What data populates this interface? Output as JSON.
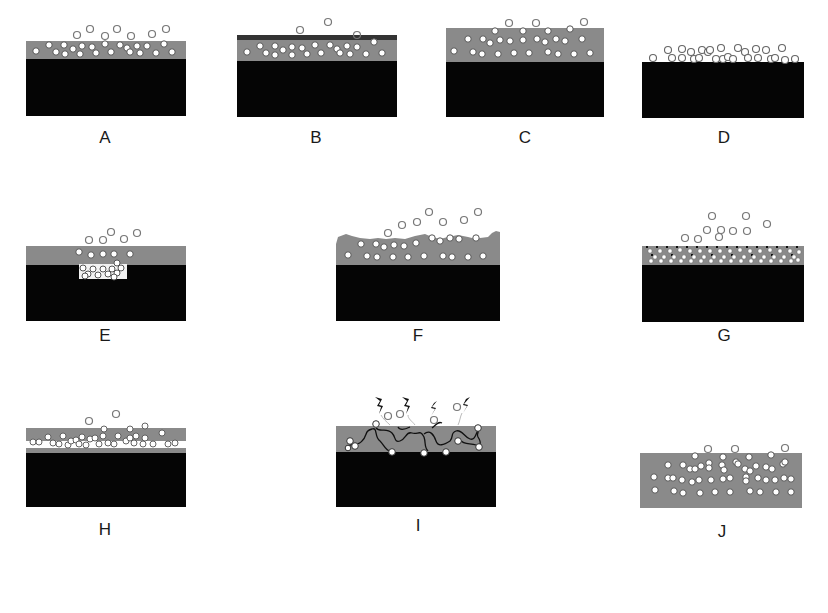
{
  "figure": {
    "colors": {
      "substrate": "#050505",
      "coating": "#8a8a8a",
      "dark_topcoat": "#333333",
      "particle_fill": "#ffffff",
      "particle_stroke": "#666666",
      "background": "#ffffff"
    },
    "panels": [
      {
        "id": "A",
        "label": "A",
        "description": "Particles dispersed in coating layer, some released above surface"
      },
      {
        "id": "B",
        "label": "B",
        "description": "Coating with dark top barrier layer, few particles released"
      },
      {
        "id": "C",
        "label": "C",
        "description": "Thick coating with particles throughout, some released"
      },
      {
        "id": "D",
        "label": "D",
        "description": "Particles deposited directly on substrate surface without coating"
      },
      {
        "id": "E",
        "label": "E",
        "description": "Particle reservoir embedded in substrate beneath coating"
      },
      {
        "id": "F",
        "label": "F",
        "description": "Eroding/degrading rough coating surface releasing particles"
      },
      {
        "id": "G",
        "label": "G",
        "description": "Porous/structured coating layer with dense particle lattice"
      },
      {
        "id": "H",
        "label": "H",
        "description": "Multilayer coating with particle-rich interlayer"
      },
      {
        "id": "I",
        "label": "I",
        "description": "Polymer chains tethering particles, cleaved by stimulus (lightning)"
      },
      {
        "id": "J",
        "label": "J",
        "description": "Free-standing particle-loaded film without substrate"
      }
    ]
  }
}
